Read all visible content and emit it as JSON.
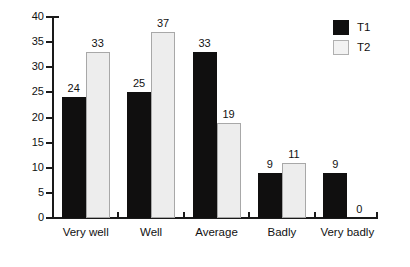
{
  "chart_data": {
    "type": "bar",
    "title": "",
    "subtitle": "",
    "xlabel": "",
    "ylabel": "",
    "categories": [
      "Very well",
      "Well",
      "Average",
      "Badly",
      "Very badly"
    ],
    "series": [
      {
        "name": "T1",
        "color": "#100f0f",
        "values": [
          24,
          25,
          33,
          9,
          9
        ]
      },
      {
        "name": "T2",
        "color": "#ededed",
        "values": [
          33,
          37,
          19,
          11,
          0
        ]
      }
    ],
    "ylim": [
      0,
      40
    ],
    "ytick_step": 5,
    "yticks": [
      0,
      5,
      10,
      15,
      20,
      25,
      30,
      35,
      40
    ],
    "ytick_labels": [
      "0",
      "5",
      "10",
      "15",
      "20",
      "25",
      "30",
      "35",
      "40"
    ],
    "grid": false,
    "data_labels": true,
    "legend": {
      "position": "top-right",
      "entries": [
        "T1",
        "T2"
      ]
    },
    "annotations": []
  },
  "axis_colors": {
    "axis_line": "#1a1a1a",
    "text": "#111111",
    "t1_fill": "#100f0f",
    "t2_fill": "#ededed",
    "t2_border": "#a8a8a8",
    "background": "#ffffff"
  }
}
